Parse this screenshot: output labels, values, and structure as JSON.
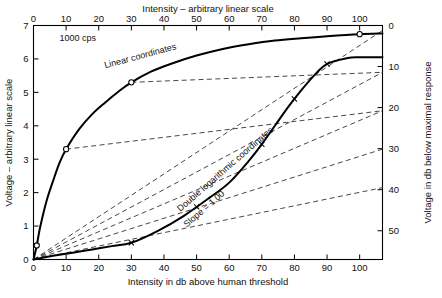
{
  "chart_data": {
    "type": "line",
    "title": "",
    "annotations": [
      {
        "name": "cps-note",
        "text": "1000 cps"
      },
      {
        "name": "linear-curve-label",
        "text": "Linear coordinates"
      },
      {
        "name": "loglog-curve-label",
        "text": "Double logarithmic coordinates"
      },
      {
        "name": "slope-label",
        "text": "Slope = 1.00"
      }
    ],
    "axes": {
      "top": {
        "label": "Intensity – arbitrary linear scale",
        "ticks": [
          0,
          10,
          20,
          30,
          40,
          50,
          60,
          70,
          80,
          90,
          100
        ],
        "range": [
          0,
          107
        ]
      },
      "bottom": {
        "label": "Intensity in db above human threshold",
        "ticks": [
          0,
          10,
          20,
          30,
          40,
          50,
          60,
          70,
          80,
          90,
          100
        ],
        "range": [
          0,
          107
        ]
      },
      "left": {
        "label": "Voltage – arbitrary linear scale",
        "ticks": [
          0,
          1,
          2,
          3,
          4,
          5,
          6,
          7
        ],
        "range": [
          0,
          7
        ]
      },
      "right": {
        "label": "Voltage in db below maximal response",
        "ticks": [
          0,
          10,
          20,
          30,
          40,
          50
        ],
        "range": [
          0,
          57
        ],
        "inverted": true
      }
    },
    "grid": false,
    "legend": null,
    "series": [
      {
        "name": "Linear coordinates",
        "style": "solid",
        "marker": "circle",
        "x": [
          0,
          1,
          2,
          4,
          6,
          8,
          10,
          14,
          18,
          22,
          26,
          30,
          36,
          42,
          50,
          58,
          66,
          74,
          82,
          90,
          100,
          107
        ],
        "y": [
          0.0,
          0.42,
          0.95,
          1.75,
          2.35,
          2.9,
          3.3,
          3.9,
          4.35,
          4.7,
          5.02,
          5.3,
          5.62,
          5.85,
          6.1,
          6.3,
          6.44,
          6.55,
          6.62,
          6.68,
          6.74,
          6.76
        ],
        "markers_at_x": [
          1,
          10,
          30,
          100
        ]
      },
      {
        "name": "Double logarithmic coordinates",
        "style": "solid",
        "marker": "cross",
        "x": [
          0,
          2,
          6,
          12,
          18,
          24,
          30,
          38,
          46,
          54,
          60,
          66,
          70,
          74,
          78,
          82,
          86,
          90,
          96,
          100,
          107
        ],
        "y": [
          0.0,
          0.04,
          0.11,
          0.2,
          0.3,
          0.4,
          0.5,
          0.85,
          1.3,
          1.85,
          2.3,
          2.95,
          3.45,
          4.0,
          4.55,
          5.05,
          5.5,
          5.85,
          6.02,
          6.05,
          6.05
        ],
        "markers_at_x": [
          30,
          50,
          70,
          80,
          90
        ]
      }
    ],
    "dashed_connectors": [
      {
        "name": "connector-1",
        "from": [
          0,
          0
        ],
        "to": [
          107,
          6.85
        ]
      },
      {
        "name": "connector-2",
        "from": [
          0,
          0
        ],
        "to": [
          107,
          5.6
        ]
      },
      {
        "name": "connector-3",
        "from": [
          0,
          0
        ],
        "to": [
          107,
          4.45
        ]
      },
      {
        "name": "connector-4",
        "from": [
          0,
          0
        ],
        "to": [
          107,
          3.3
        ]
      },
      {
        "name": "connector-5",
        "from": [
          0,
          0
        ],
        "to": [
          107,
          2.15
        ]
      },
      {
        "name": "connector-upper-1",
        "from": [
          10,
          3.3
        ],
        "to": [
          107,
          4.45
        ]
      },
      {
        "name": "connector-upper-2",
        "from": [
          30,
          5.3
        ],
        "to": [
          107,
          5.6
        ]
      }
    ]
  }
}
